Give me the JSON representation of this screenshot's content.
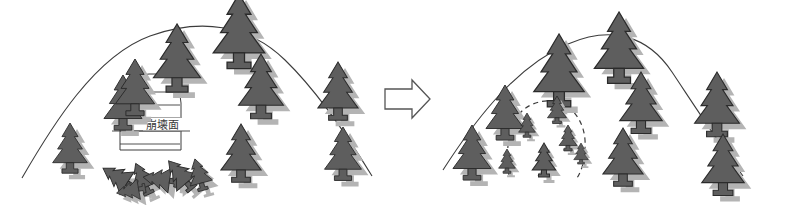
{
  "figure": {
    "title": "",
    "background_color": "#ffffff",
    "width": 807,
    "height": 205
  },
  "colors": {
    "tree_fill": "#5e5e5e",
    "tree_outline": "#2b2b2b",
    "tree_shadow": "#b4b4b4",
    "hill_line": "#3c3c3c",
    "hatch_line": "#3c3c3c",
    "dashed_line": "#3c3c3c",
    "arrow_outline": "#555555",
    "label_text": "#3a3a3a"
  },
  "panels": [
    {
      "id": "before",
      "name": "slope-collapse-panel",
      "label": "",
      "hill": {
        "shape": "arched-ridge",
        "line_style": "solid"
      },
      "collapse_area": {
        "label": "崩壊面",
        "label_reading": "houkaimen",
        "fill": "horizontal-hatch",
        "hatch_line_count": 5,
        "outline_style": "solid"
      },
      "standing_trees": 10,
      "fallen_trees": 6,
      "fallen_trees_note": "toppled trees at the foot of the collapse"
    },
    {
      "id": "after",
      "name": "revegetation-panel",
      "label": "",
      "hill": {
        "shape": "arched-ridge",
        "line_style": "solid"
      },
      "recovery_area": {
        "label": "",
        "fill": "none",
        "outline_style": "dashed",
        "young_trees": 6
      },
      "standing_trees": 9,
      "fallen_trees": 0
    }
  ],
  "arrow": {
    "name": "transition-arrow",
    "direction": "right",
    "style": "outlined-block-arrow",
    "label": ""
  }
}
